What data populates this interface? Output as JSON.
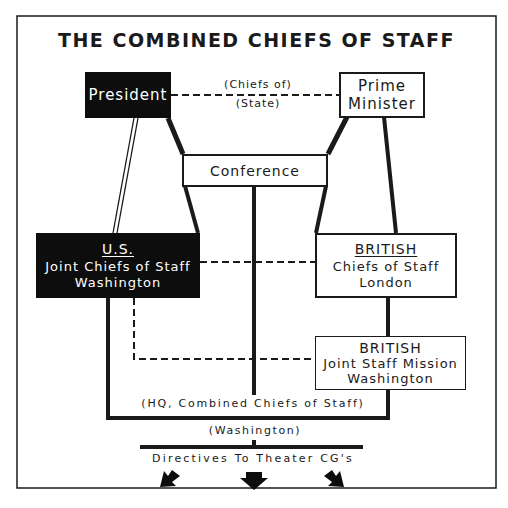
{
  "title": "THE COMBINED CHIEFS OF STAFF",
  "nodes": {
    "president": {
      "label": "President"
    },
    "prime_minister": {
      "line1": "Prime",
      "line2": "Minister"
    },
    "conference": {
      "label": "Conference"
    },
    "us_jcs": {
      "heading": "U.S.",
      "line1": "Joint Chiefs of Staff",
      "line2": "Washington"
    },
    "british_cos": {
      "heading": "BRITISH",
      "line1": "Chiefs of Staff",
      "line2": "London"
    },
    "british_jsm": {
      "heading": "BRITISH",
      "line1": "Joint Staff Mission",
      "line2": "Washington"
    }
  },
  "labels": {
    "chiefs_of_state_1": "(Chiefs of)",
    "chiefs_of_state_2": "(State)",
    "hq": "(HQ, Combined Chiefs of Staff)",
    "washington": "(Washington)",
    "directives": "Directives To Theater CG's"
  },
  "colors": {
    "ink": "#1a1a1a",
    "paper": "#ffffff",
    "dark_box": "#0d0d0d"
  }
}
